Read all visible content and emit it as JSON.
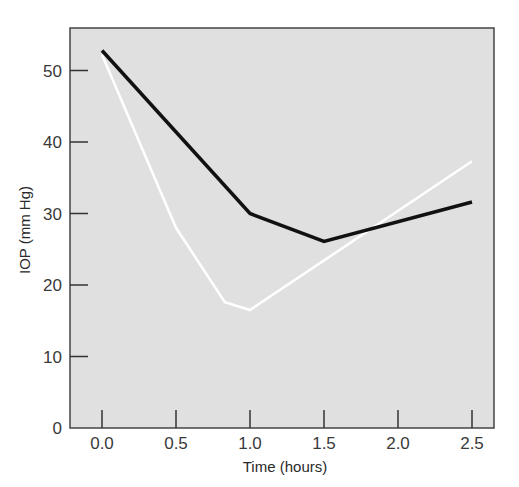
{
  "chart_data": {
    "type": "line",
    "title": "",
    "xlabel": "Time (hours)",
    "ylabel": "IOP (mm Hg)",
    "xlim": [
      -0.15,
      2.62
    ],
    "ylim": [
      0,
      56
    ],
    "xticks": [
      0.0,
      0.5,
      1.0,
      1.5,
      2.0,
      2.5
    ],
    "xtick_labels": [
      "0.0",
      "0.5",
      "1.0",
      "1.5",
      "2.0",
      "2.5"
    ],
    "yticks": [
      0,
      10,
      20,
      30,
      40,
      50
    ],
    "ytick_labels": [
      "0",
      "10",
      "20",
      "30",
      "40",
      "50"
    ],
    "grid": false,
    "legend": null,
    "background": "#e0e0e0",
    "series": [
      {
        "name": "black-line",
        "color": "#111111",
        "points": [
          [
            0.0,
            52.8
          ],
          [
            1.0,
            30.0
          ],
          [
            1.5,
            26.1
          ],
          [
            2.5,
            31.6
          ]
        ]
      },
      {
        "name": "white-line",
        "color": "#ffffff",
        "points": [
          [
            0.0,
            52.2
          ],
          [
            0.5,
            28.0
          ],
          [
            0.83,
            17.6
          ],
          [
            1.0,
            16.5
          ],
          [
            2.5,
            37.3
          ]
        ]
      }
    ]
  }
}
